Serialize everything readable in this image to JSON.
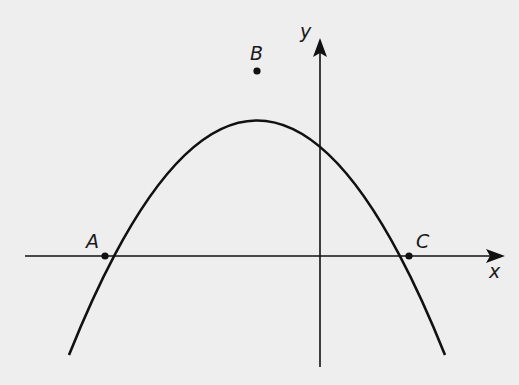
{
  "diagram": {
    "title": "",
    "axes": {
      "x_label": "x",
      "y_label": "y"
    },
    "points": [
      {
        "name": "A",
        "label": "A",
        "description": "left x-intercept of parabola"
      },
      {
        "name": "B",
        "label": "B",
        "description": "vertex (maximum) of parabola"
      },
      {
        "name": "C",
        "label": "C",
        "description": "right x-intercept of parabola"
      }
    ],
    "curve": {
      "type": "downward parabola",
      "color": "#111111"
    },
    "colors": {
      "background": "#eeeeee",
      "ink": "#111111"
    }
  }
}
